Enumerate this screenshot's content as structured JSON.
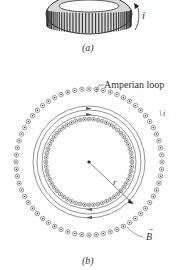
{
  "figure_a": {
    "caption": "(a)",
    "current_label": "i",
    "description": "toroid with closely wound coil"
  },
  "figure_b": {
    "caption": "(b)",
    "amperian_loop_label": "Amperian loop",
    "current_label": "i",
    "radius_label": "r",
    "field_label": "B",
    "field_vector_arrow": "→"
  },
  "colors": {
    "line": "#555555",
    "coil": "#444444",
    "background": "#ffffff"
  }
}
